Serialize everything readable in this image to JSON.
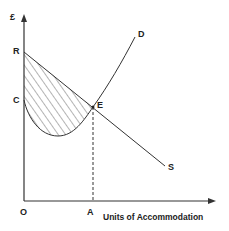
{
  "diagram": {
    "y_axis_label": "£",
    "x_axis_label": "Units of Accommodation",
    "points": {
      "origin": "O",
      "R": "R",
      "C": "C",
      "E": "E",
      "A": "A",
      "D": "D",
      "S": "S"
    },
    "curves": [
      {
        "name": "D",
        "description": "Upward-sloping curve from C dipping then rising through E to D"
      },
      {
        "name": "S",
        "description": "Downward-sloping straight line from R through E to S"
      }
    ],
    "shaded_region": "Area between line RS and curve CD, left of E",
    "colors": {
      "line": "#333333",
      "background": "#ffffff"
    }
  }
}
